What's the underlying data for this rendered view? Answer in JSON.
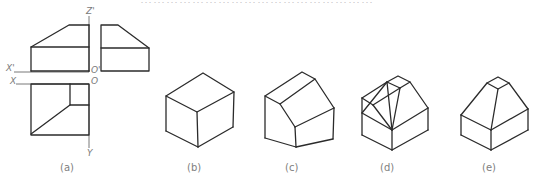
{
  "header": {
    "cropped_text": "………………………………………………"
  },
  "figure_a": {
    "caption": "(a)",
    "axis_labels": {
      "z_prime": "Z'",
      "x_prime": "X'",
      "x": "X",
      "o_prime": "O'",
      "o": "O",
      "y": "Y"
    },
    "views": [
      "front-view",
      "side-view",
      "top-view"
    ]
  },
  "figure_b": {
    "caption": "(b)",
    "description": "isometric rectangular box"
  },
  "figure_c": {
    "caption": "(c)",
    "description": "box with sloped cut on front-left edge"
  },
  "figure_d": {
    "caption": "(d)",
    "description": "construction of pyramidal frustum top"
  },
  "figure_e": {
    "caption": "(e)",
    "description": "final isometric solid"
  },
  "colors": {
    "line": "#2b2b2b",
    "axis": "#6a6a6a",
    "label": "#808080",
    "background": "#ffffff"
  }
}
